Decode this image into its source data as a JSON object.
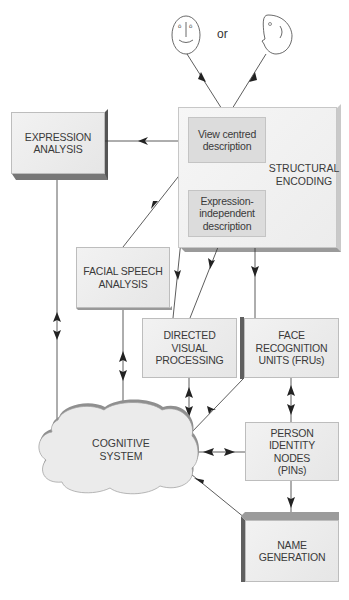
{
  "faces": {
    "front_face_icon": "front-face",
    "or_label": "or",
    "profile_face_icon": "profile-face"
  },
  "nodes": {
    "expression_analysis": [
      "EXPRESSION",
      "ANALYSIS"
    ],
    "view_centred": [
      "View centred",
      "description"
    ],
    "structural_encoding": [
      "STRUCTURAL",
      "ENCODING"
    ],
    "expression_independent": [
      "Expression-",
      "independent",
      "description"
    ],
    "facial_speech": [
      "FACIAL SPEECH",
      "ANALYSIS"
    ],
    "directed_visual": [
      "DIRECTED",
      "VISUAL",
      "PROCESSING"
    ],
    "fru": [
      "FACE",
      "RECOGNITION",
      "UNITS (FRUs)"
    ],
    "cognitive_system": [
      "COGNITIVE",
      "SYSTEM"
    ],
    "pin": [
      "PERSON",
      "IDENTITY",
      "NODES",
      "(PINs)"
    ],
    "name_generation": [
      "NAME",
      "GENERATION"
    ]
  },
  "colors": {
    "box_face": "#ebebeb",
    "inner_box": "#dcdcdc",
    "shadow": "#8a8a8a",
    "edge_dark": "#6f6f6f",
    "line": "#333333"
  }
}
